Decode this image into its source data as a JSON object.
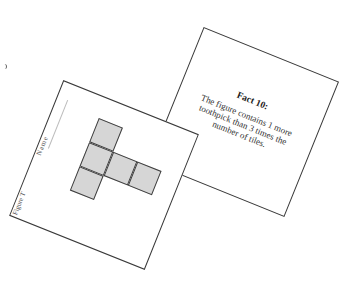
{
  "fact_card": {
    "title": "Fact 10:",
    "body": "The figure contains 1 more toothpick than 3 times the number of tiles."
  },
  "figure_card": {
    "name_label": "Name",
    "figure_label": "Figure T",
    "tiles": [
      {
        "col": 0,
        "row": 0
      },
      {
        "col": 0,
        "row": 1
      },
      {
        "col": 1,
        "row": 1
      },
      {
        "col": 2,
        "row": 1
      },
      {
        "col": 0,
        "row": 2
      }
    ],
    "tile_count": 5
  },
  "colors": {
    "card_border": "#3a3a3a",
    "tile_fill": "#d6d6d6",
    "background": "#ffffff"
  }
}
